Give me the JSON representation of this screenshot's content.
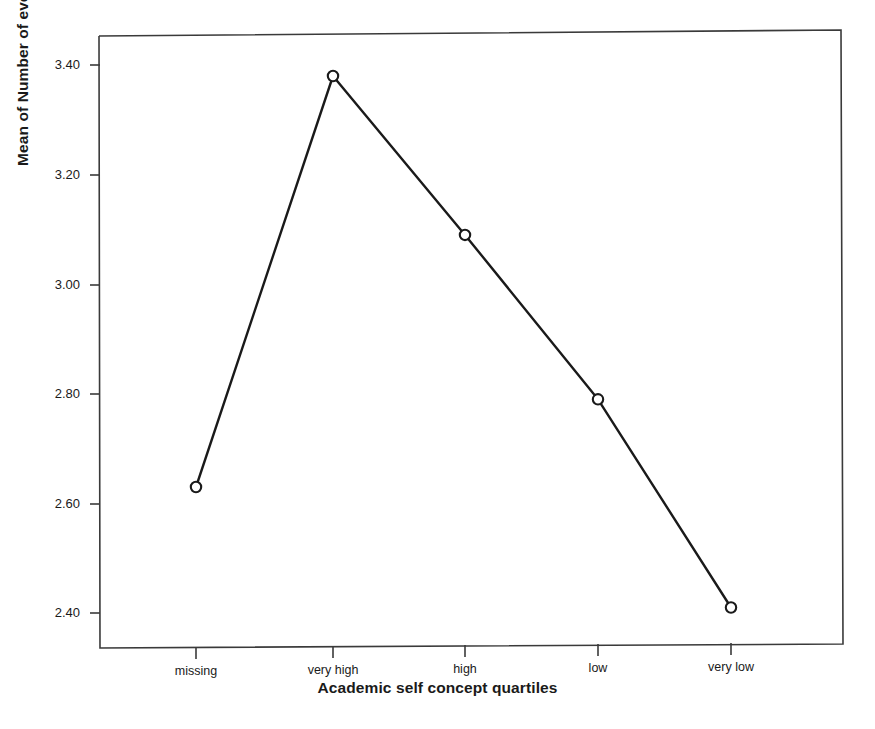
{
  "chart_data": {
    "type": "line",
    "title": "",
    "subtitle": "",
    "xlabel": "Academic self concept quartiles",
    "ylabel": "Mean of Number of evening homework per week",
    "categories": [
      "missing",
      "very high",
      "high",
      "low",
      "very low"
    ],
    "values": [
      2.63,
      3.38,
      3.09,
      2.79,
      2.41
    ],
    "series": [
      {
        "name": "Mean of Number of evening homework per week",
        "values": [
          2.63,
          3.38,
          3.09,
          2.79,
          2.41
        ]
      }
    ],
    "ylim": [
      2.31,
      3.45
    ],
    "y_ticks": [
      2.4,
      2.6,
      2.8,
      3.0,
      3.2,
      3.4
    ],
    "y_tick_labels": [
      "2.40",
      "2.60",
      "2.80",
      "3.00",
      "3.20",
      "3.40"
    ],
    "x_tick_labels": [
      "missing",
      "very high",
      "high",
      "low",
      "very low"
    ],
    "grid": false,
    "legend": false,
    "legend_position": "none",
    "marker": "open-circle",
    "line_color": "#1a1a1a",
    "marker_color": "#1a1a1a",
    "frame_color": "#3a3a3a",
    "background": "#ffffff"
  },
  "axes": {
    "y_title": "Mean of Number of evening homework per week",
    "x_title": "Academic self concept quartiles",
    "y_labels": [
      "3.40",
      "3.20",
      "3.00",
      "2.80",
      "2.60",
      "2.40"
    ],
    "x_labels": [
      "missing",
      "very high",
      "high",
      "low",
      "very low"
    ]
  }
}
